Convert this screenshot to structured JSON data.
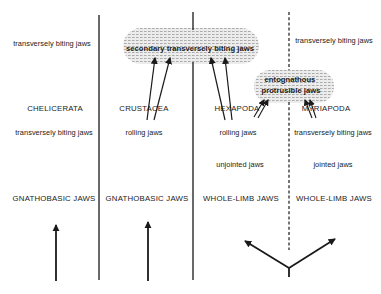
{
  "diagram": {
    "columns": [
      {
        "taxon": "CHELICERATA",
        "top_trait": "transversely biting jaws",
        "jaw_motion": "transversely biting jaws",
        "jaw_type": "GNATHOBASIC JAWS"
      },
      {
        "taxon": "CRUSTACEA",
        "jaw_motion": "rolling jaws",
        "jaw_type": "GNATHOBASIC JAWS"
      },
      {
        "taxon": "HEXAPODA",
        "jaw_motion": "rolling jaws",
        "jointing": "unjointed jaws",
        "jaw_type": "WHOLE-LIMB JAWS"
      },
      {
        "taxon": "MYRIAPODA",
        "top_trait": "transversely biting jaws",
        "jaw_motion": "transversely biting jaws",
        "jointing": "jointed jaws",
        "jaw_type": "WHOLE-LIMB JAWS"
      }
    ],
    "shared_traits": {
      "secondary": "secondary transversely biting jaws",
      "entognathous_line1": "entognathous",
      "entognathous_line2": "protrusible jaws"
    },
    "colors": {
      "ink": "#1a1a1a",
      "blob_fill": "#d9d9d9"
    }
  }
}
